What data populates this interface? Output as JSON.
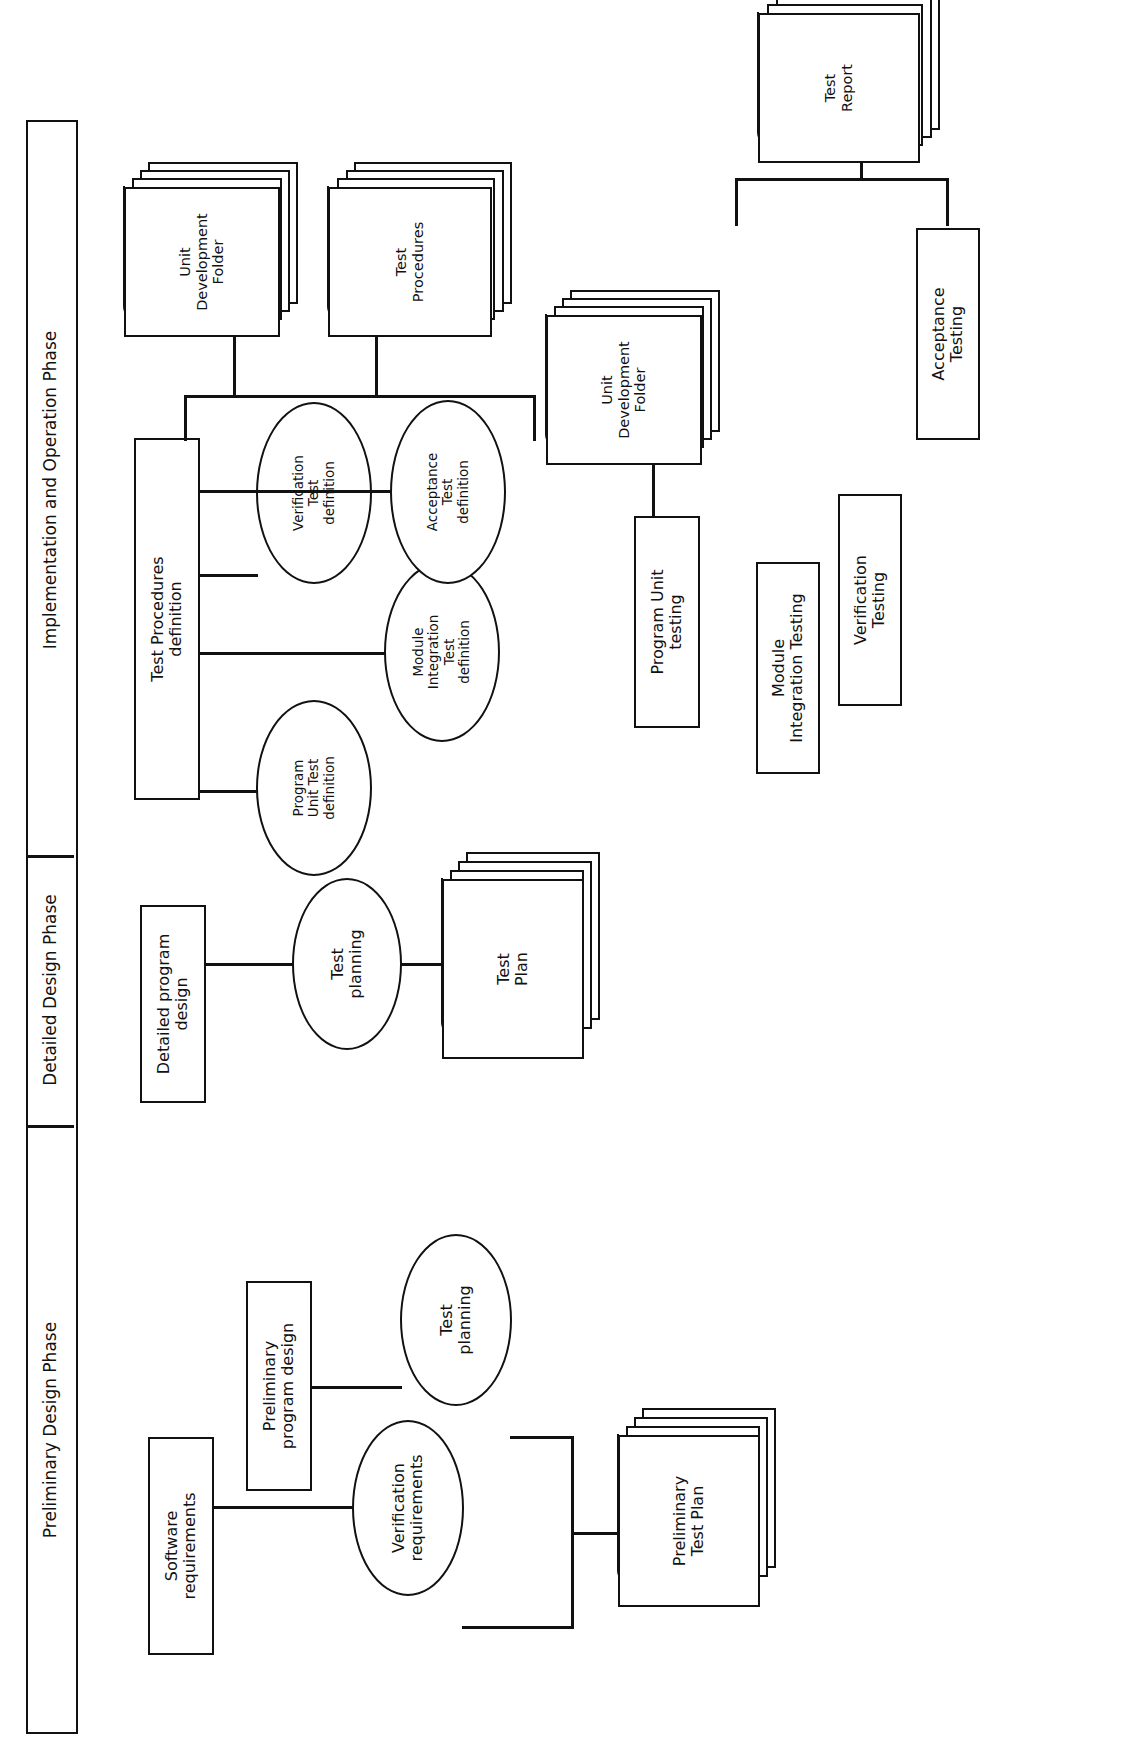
{
  "diagram": {
    "orientation": "rotated-90-ccw",
    "stroke_color": "#111111",
    "background_color": "#ffffff"
  },
  "phase_bar": {
    "phases": [
      {
        "label": "Implementation and Operation Phase"
      },
      {
        "label": "Detailed Design Phase"
      },
      {
        "label": "Preliminary Design Phase"
      }
    ]
  },
  "nodes": {
    "software_requirements": "Software\nrequirements",
    "preliminary_program_design": "Preliminary\nprogram design",
    "verification_requirements": "Verification\nrequirements",
    "test_planning_prelim": "Test\nplanning",
    "preliminary_test_plan": "Preliminary\nTest Plan",
    "detailed_program_design": "Detailed program\ndesign",
    "test_planning_detailed": "Test\nplanning",
    "test_plan": "Test\nPlan",
    "test_procedures_definition": "Test Procedures\ndefinition",
    "program_unit_test_definition": "Program\nUnit Test\ndefinition",
    "module_integration_test_definition": "Module\nIntegration\nTest\ndefinition",
    "verification_test_definition": "Verification\nTest\ndefinition",
    "acceptance_test_definition": "Acceptance\nTest\ndefinition",
    "unit_development_folder_top": "Unit\nDevelopment\nFolder",
    "test_procedures_doc": "Test\nProcedures",
    "unit_development_folder_mid": "Unit\nDevelopment\nFolder",
    "program_unit_testing": "Program Unit\ntesting",
    "module_integration_testing": "Module\nIntegration Testing",
    "verification_testing": "Verification\nTesting",
    "acceptance_testing": "Acceptance\nTesting",
    "test_report": "Test\nReport"
  }
}
